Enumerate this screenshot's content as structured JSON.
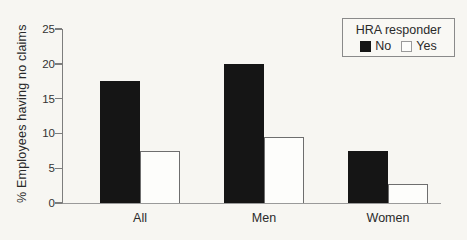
{
  "figure": {
    "background": "#f7f6f2"
  },
  "chart_data": {
    "type": "bar",
    "title": "",
    "categories": [
      "All",
      "Men",
      "Women"
    ],
    "series": [
      {
        "name": "No",
        "values": [
          17.5,
          20.0,
          7.5
        ]
      },
      {
        "name": "Yes",
        "values": [
          7.5,
          9.5,
          2.7
        ]
      }
    ],
    "xlabel": "",
    "ylabel": "% Employees having no claims",
    "ylim": [
      0,
      25
    ],
    "yticks": [
      0,
      5,
      10,
      15,
      20,
      25
    ],
    "grid": false,
    "legend": {
      "title": "HRA responder",
      "entries": [
        "No",
        "Yes"
      ],
      "position": "top-right"
    },
    "colors": {
      "No": "#151515",
      "Yes": "#fdfdfb"
    }
  }
}
